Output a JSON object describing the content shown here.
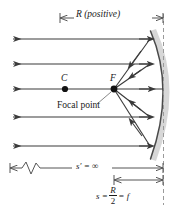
{
  "figure": {
    "labels": {
      "radius": "R (positive)",
      "center": "C",
      "focus": "F",
      "focal_point": "Focal point",
      "object_distance_infinite": "s′ = ∞",
      "image_distance_prefix": "s =",
      "fraction_numerator": "R",
      "fraction_denominator": "2",
      "image_distance_suffix": "= f"
    },
    "colors": {
      "ray": "#3a3a3a",
      "mirror": "#4a4a4a",
      "mirror_shade": "#c9c9c9",
      "dimension": "#555555",
      "dashed": "#9a9a9a",
      "text": "#1a1a1a",
      "background": "#ffffff"
    },
    "geometry": {
      "mirror_vertex_x": 163,
      "focus_x": 114,
      "center_x": 65,
      "axis_y": 89,
      "ray_y_positions": [
        39,
        64,
        89,
        117,
        146
      ],
      "arc_top_y": 32,
      "arc_bottom_y": 158
    }
  }
}
